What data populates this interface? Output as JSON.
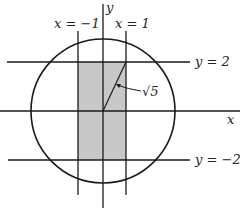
{
  "diagram": {
    "axes": {
      "x_label": "x",
      "y_label": "y"
    },
    "lines": {
      "x_neg1": "x = −1",
      "x_pos1": "x = 1",
      "y_pos2": "y = 2",
      "y_neg2": "y = −2"
    },
    "radius_label": "√5",
    "shaded_region": "rectangle −1 ≤ x ≤ 1, −2 ≤ y ≤ 2",
    "circle": "radius √5 centered at origin",
    "colors": {
      "shade": "#c8c8c8",
      "stroke": "#1a1a1a"
    }
  }
}
